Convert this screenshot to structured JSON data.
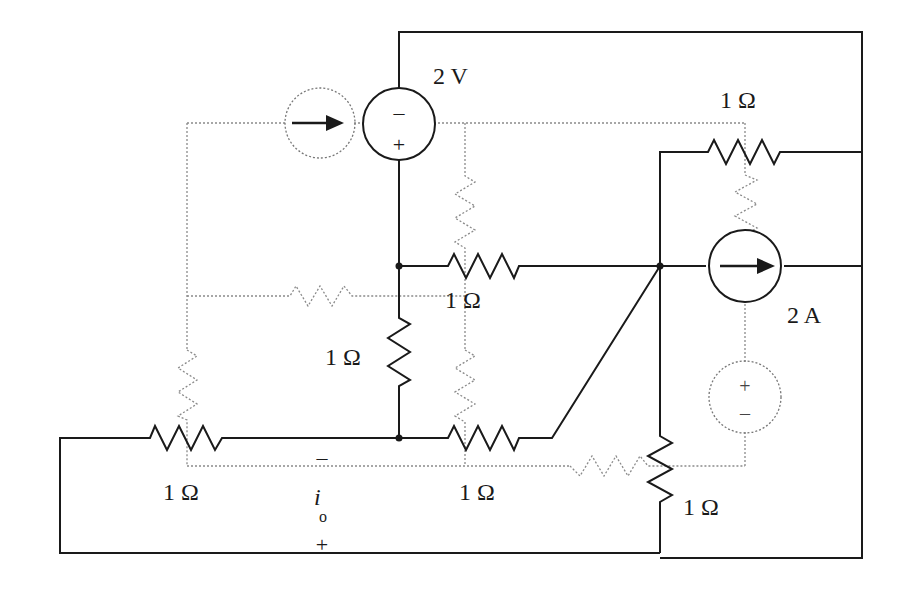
{
  "diagram": {
    "type": "circuit-schematic",
    "labels": {
      "voltage_source": "2 V",
      "current_source": "2 A",
      "r_top_right": "1 Ω",
      "r_middle_horizontal": "1 Ω",
      "r_middle_vertical": "1 Ω",
      "r_bottom_left": "1 Ω",
      "r_bottom_middle": "1 Ω",
      "r_bottom_right": "1 Ω",
      "current_var": "i",
      "current_sub": "o",
      "io_minus": "–",
      "io_plus": "+"
    },
    "symbols": {
      "vs_minus": "–",
      "vs_plus": "+",
      "dual_vs_plus": "+",
      "dual_vs_minus": "–"
    },
    "colors": {
      "wire": "#1a1a1a",
      "dual_overlay": "#8a8a8a",
      "background": "#ffffff"
    }
  }
}
